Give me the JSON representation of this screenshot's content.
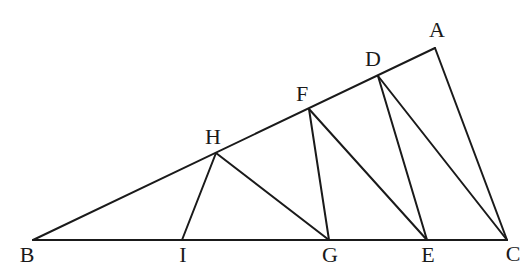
{
  "diagram": {
    "type": "geometry-triangle-construction",
    "stroke_color": "#1a1a1a",
    "background": "#ffffff",
    "points": {
      "A": {
        "x": 435,
        "y": 48
      },
      "B": {
        "x": 33,
        "y": 240
      },
      "C": {
        "x": 507,
        "y": 240
      },
      "D": {
        "x": 378,
        "y": 76
      },
      "E": {
        "x": 427,
        "y": 240
      },
      "F": {
        "x": 309,
        "y": 109
      },
      "G": {
        "x": 329,
        "y": 240
      },
      "H": {
        "x": 216,
        "y": 153
      },
      "I": {
        "x": 182,
        "y": 240
      }
    },
    "labels": [
      {
        "text": "A",
        "x": 437,
        "y": 32
      },
      {
        "text": "B",
        "x": 27,
        "y": 257
      },
      {
        "text": "C",
        "x": 513,
        "y": 256
      },
      {
        "text": "D",
        "x": 373,
        "y": 61
      },
      {
        "text": "E",
        "x": 428,
        "y": 257
      },
      {
        "text": "F",
        "x": 302,
        "y": 96
      },
      {
        "text": "G",
        "x": 330,
        "y": 257
      },
      {
        "text": "H",
        "x": 213,
        "y": 139
      },
      {
        "text": "I",
        "x": 183,
        "y": 257
      }
    ],
    "segments": [
      {
        "from": "B",
        "to": "A"
      },
      {
        "from": "B",
        "to": "C"
      },
      {
        "from": "A",
        "to": "C"
      },
      {
        "from": "D",
        "to": "C"
      },
      {
        "from": "D",
        "to": "E"
      },
      {
        "from": "F",
        "to": "E"
      },
      {
        "from": "F",
        "to": "G"
      },
      {
        "from": "H",
        "to": "G"
      },
      {
        "from": "H",
        "to": "I"
      }
    ]
  }
}
